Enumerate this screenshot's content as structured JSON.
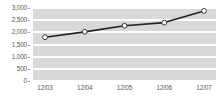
{
  "chart_data": {
    "type": "line",
    "title": "",
    "subtitle": "",
    "xlabel": "",
    "ylabel": "",
    "categories": [
      "12/03",
      "12/04",
      "12/05",
      "12/06",
      "12/07"
    ],
    "values": [
      1800,
      2020,
      2270,
      2400,
      2880
    ],
    "series": [
      {
        "name": "",
        "values": [
          1800,
          2020,
          2270,
          2400,
          2880
        ]
      }
    ],
    "ylim": [
      0,
      3000
    ],
    "ytick_values": [
      3000,
      2500,
      2000,
      1500,
      1000,
      500,
      0
    ],
    "ytick_labels": [
      "3,000",
      "2,500",
      "2,000",
      "1,500",
      "1,000",
      "500",
      "0"
    ],
    "grid": true,
    "grid_color": "#ffffff",
    "plot_background": "#d9d9d9",
    "legend": false,
    "legend_position": "none",
    "line_color": "#222222",
    "marker_style": "open-circle",
    "marker_fill": "#ffffff",
    "marker_stroke": "#3a3a3a",
    "axis_text_color": "#5a5a5a"
  }
}
